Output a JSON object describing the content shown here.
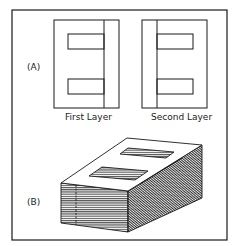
{
  "figure": {
    "part_a": {
      "label": "(A)",
      "first_caption": "First Layer",
      "second_caption": "Second Layer"
    },
    "part_b": {
      "label": "(B)"
    },
    "colors": {
      "stroke": "#1a1a1a",
      "background": "#ffffff"
    }
  }
}
